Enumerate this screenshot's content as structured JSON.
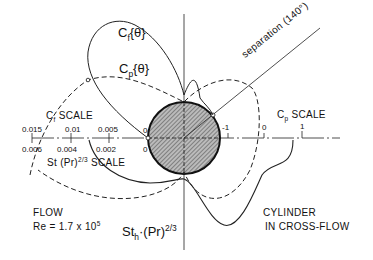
{
  "diagram": {
    "labels": {
      "cf_theta": "C",
      "cf_theta_sub": "f",
      "cf_theta_arg": "{θ}",
      "cp_theta": "C",
      "cp_theta_sub": "p",
      "cp_theta_arg": "{θ}",
      "separation": "separation (140°)",
      "cf_scale": "C",
      "cf_scale_sub": "f",
      "cf_scale_word": "SCALE",
      "cp_scale": "C",
      "cp_scale_sub": "p",
      "cp_scale_word": "SCALE",
      "st_scale": "St (Pr)",
      "st_scale_sup": "2/3",
      "st_scale_word": "SCALE",
      "sth": "St",
      "sth_sub": "h",
      "sth_rest": "·(Pr)",
      "sth_sup": "2/3",
      "flow": "FLOW",
      "re": "Re = 1.7 x 10",
      "re_sup": "5",
      "cylinder_line1": "CYLINDER",
      "cylinder_line2": "IN CROSS-FLOW"
    },
    "cf_ticks": [
      "0.015",
      "0.01",
      "0.005",
      "0"
    ],
    "st_ticks": [
      "0.006",
      "0.004",
      "0.002",
      "0"
    ],
    "cp_ticks": [
      "-1",
      "0",
      "1"
    ],
    "separation_angle_deg": 140,
    "reynolds_number": "1.7 x 10^5"
  }
}
